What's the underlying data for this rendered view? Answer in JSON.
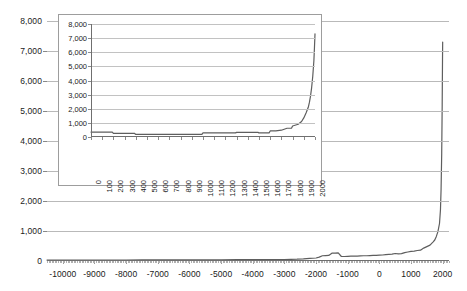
{
  "chart_data": {
    "type": "line",
    "title": "",
    "xlabel": "",
    "ylabel": "",
    "xlim": [
      -10500,
      2200
    ],
    "ylim": [
      0,
      8000
    ],
    "grid": true,
    "legend": "none",
    "line_color": "#5e5e5e",
    "grid_color": "#b9b9b9",
    "axis_color": "#6f6f6f",
    "text_color": "#1a1a1a",
    "background": "#ffffff",
    "yticks": [
      "0",
      "1,000",
      "2,000",
      "3,000",
      "4,000",
      "5,000",
      "6,000",
      "7,000",
      "8,000"
    ],
    "ytick_values": [
      0,
      1000,
      2000,
      3000,
      4000,
      5000,
      6000,
      7000,
      8000
    ],
    "xticks": [
      "-10000",
      "-9000",
      "-8000",
      "-7000",
      "-6000",
      "-5000",
      "-4000",
      "-3000",
      "-2000",
      "-1000",
      "0",
      "1000",
      "2000"
    ],
    "xtick_values": [
      -10000,
      -9000,
      -8000,
      -7000,
      -6000,
      -5000,
      -4000,
      -3000,
      -2000,
      -1000,
      0,
      1000,
      2000
    ],
    "x": [
      -10500,
      -10000,
      -9500,
      -9000,
      -8500,
      -8000,
      -7500,
      -7000,
      -6500,
      -6000,
      -5500,
      -5000,
      -4500,
      -4000,
      -3500,
      -3000,
      -2800,
      -2600,
      -2400,
      -2200,
      -2000,
      -1900,
      -1800,
      -1700,
      -1600,
      -1500,
      -1400,
      -1300,
      -1200,
      -1100,
      -1000,
      -900,
      -800,
      -700,
      -600,
      -500,
      -400,
      -300,
      -200,
      -100,
      0,
      100,
      200,
      300,
      400,
      500,
      600,
      700,
      800,
      900,
      1000,
      1100,
      1200,
      1300,
      1400,
      1500,
      1600,
      1700,
      1750,
      1800,
      1850,
      1900,
      1930,
      1950,
      1970,
      1985,
      1995,
      2000
    ],
    "y": [
      30,
      30,
      32,
      32,
      34,
      34,
      36,
      36,
      38,
      40,
      40,
      42,
      44,
      46,
      48,
      50,
      55,
      60,
      70,
      85,
      100,
      130,
      175,
      180,
      185,
      260,
      265,
      270,
      150,
      150,
      155,
      160,
      160,
      165,
      170,
      175,
      175,
      180,
      185,
      190,
      195,
      200,
      210,
      220,
      230,
      250,
      240,
      245,
      280,
      300,
      320,
      330,
      350,
      360,
      430,
      480,
      530,
      640,
      700,
      820,
      980,
      1250,
      1700,
      2400,
      3600,
      5200,
      6700,
      7300
    ]
  },
  "inset_chart_data": {
    "type": "line",
    "title": "",
    "xlabel": "",
    "ylabel": "",
    "xlim": [
      0,
      2000
    ],
    "ylim": [
      0,
      8000
    ],
    "grid": true,
    "legend": "none",
    "line_color": "#5e5e5e",
    "grid_color": "#c2c2c2",
    "axis_color": "#6f6f6f",
    "background": "#ffffff",
    "yticks": [
      "0",
      "1,000",
      "2,000",
      "3,000",
      "4,000",
      "5,000",
      "6,000",
      "7,000",
      "8,000"
    ],
    "ytick_values": [
      0,
      1000,
      2000,
      3000,
      4000,
      5000,
      6000,
      7000,
      8000
    ],
    "xticks": [
      "0",
      "100",
      "200",
      "300",
      "400",
      "500",
      "600",
      "700",
      "800",
      "900",
      "1000",
      "1100",
      "1200",
      "1300",
      "1400",
      "1500",
      "1600",
      "1700",
      "1800",
      "1900",
      "2000"
    ],
    "xtick_values": [
      0,
      100,
      200,
      300,
      400,
      500,
      600,
      700,
      800,
      900,
      1000,
      1100,
      1200,
      1300,
      1400,
      1500,
      1600,
      1700,
      1800,
      1900,
      2000
    ],
    "x": [
      0,
      50,
      100,
      150,
      190,
      200,
      250,
      300,
      350,
      390,
      400,
      450,
      500,
      550,
      600,
      650,
      700,
      750,
      800,
      850,
      900,
      950,
      990,
      1000,
      1050,
      1100,
      1150,
      1200,
      1250,
      1290,
      1300,
      1350,
      1400,
      1450,
      1490,
      1500,
      1550,
      1590,
      1600,
      1650,
      1700,
      1750,
      1790,
      1800,
      1850,
      1880,
      1900,
      1920,
      1940,
      1950,
      1960,
      1970,
      1980,
      1990,
      1995,
      2000
    ],
    "y": [
      350,
      350,
      350,
      350,
      350,
      250,
      250,
      250,
      250,
      250,
      180,
      180,
      180,
      180,
      180,
      180,
      180,
      180,
      180,
      180,
      180,
      180,
      180,
      290,
      290,
      290,
      290,
      290,
      290,
      290,
      330,
      330,
      330,
      330,
      330,
      290,
      290,
      290,
      430,
      430,
      480,
      620,
      620,
      780,
      900,
      1100,
      1350,
      1700,
      2100,
      2450,
      2900,
      3500,
      4300,
      5400,
      6300,
      7300
    ]
  }
}
